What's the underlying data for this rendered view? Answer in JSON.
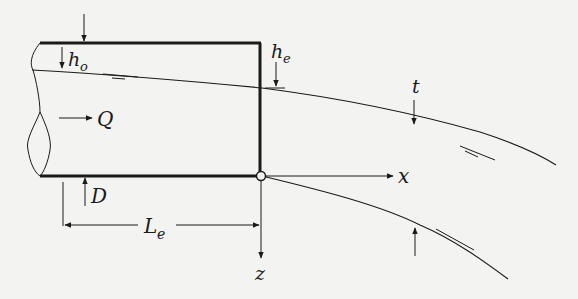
{
  "figure": {
    "type": "free-jet outflow from a horizontal pipe (trajectory of jet)",
    "labels": {
      "h_o": {
        "main": "h",
        "sub": "o"
      },
      "h_e": {
        "main": "h",
        "sub": "e"
      },
      "Q": "Q",
      "D": "D",
      "L_e": {
        "main": "L",
        "sub": "e"
      },
      "x": "x",
      "z": "z",
      "t": "t"
    },
    "colors": {
      "ink": "#1a1a1a",
      "paper": "#f3f3f1"
    }
  }
}
